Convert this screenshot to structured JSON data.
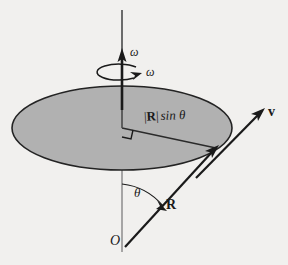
{
  "figure": {
    "background_color": "#f1f0ee",
    "ink_color": "#1a1a1a"
  },
  "disk": {
    "name": "rotating-disk",
    "fill_color": "#b1b1b1",
    "stroke_color": "#262626",
    "center_x": 122,
    "center_y": 128,
    "radius_x": 110,
    "radius_y": 42
  },
  "axis": {
    "name": "rotation-axis",
    "x": 122,
    "top_y": 10,
    "bottom_y": 252,
    "arrow_tip_y": 52
  },
  "labels": {
    "omega_axis": "ω",
    "omega_curve": "ω",
    "radius_projection_bar_open": "|",
    "radius_projection_vector": "R",
    "radius_projection_bar_close": "|",
    "radius_projection_sin": "sin",
    "radius_projection_theta": "θ",
    "angle_theta": "θ",
    "position_vector": "R",
    "velocity_vector": "v",
    "origin": "O"
  },
  "vectors": [
    {
      "name": "position-vector-R",
      "label": "R",
      "from_x": 125,
      "from_y": 246,
      "to_x": 216,
      "to_y": 148
    },
    {
      "name": "velocity-vector-v",
      "label": "v",
      "from_x": 196,
      "from_y": 177,
      "to_x": 264,
      "to_y": 110
    },
    {
      "name": "angular-velocity-omega",
      "label": "ω",
      "from_x": 122,
      "from_y": 100,
      "to_x": 122,
      "to_y": 52
    }
  ],
  "markers": {
    "right_angle": {
      "name": "right-angle-marker",
      "x": 122,
      "y": 128,
      "size": 9
    },
    "angle_arc": {
      "name": "theta-angle-arc",
      "vertex_x": 125,
      "vertex_y": 246,
      "radius": 62
    },
    "rotation_arrow": {
      "name": "rotation-direction-arrow",
      "center_x": 122,
      "center_y": 72,
      "radius_x": 22,
      "radius_y": 8
    }
  }
}
